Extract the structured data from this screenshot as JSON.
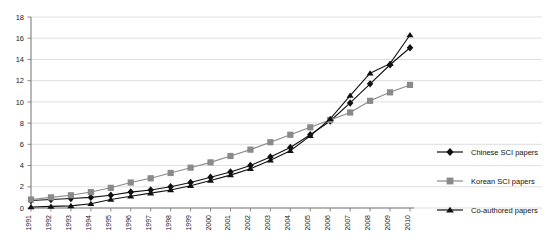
{
  "chart_data": {
    "type": "line",
    "title": "",
    "subtitle": "",
    "xlabel": "",
    "ylabel": "",
    "xlim": [
      1991,
      2010
    ],
    "ylim": [
      0,
      18
    ],
    "ytick_step": 2,
    "grid": true,
    "grid_axis": "y",
    "legend_position": "right",
    "categories": [
      "1991",
      "1992",
      "1993",
      "1994",
      "1995",
      "1996",
      "1997",
      "1998",
      "1999",
      "2000",
      "2001",
      "2002",
      "2003",
      "2004",
      "2005",
      "2006",
      "2007",
      "2008",
      "2009",
      "2010"
    ],
    "yticks": [
      0,
      2,
      4,
      6,
      8,
      10,
      12,
      14,
      16,
      18
    ],
    "series": [
      {
        "name": "Chinese SCI papers",
        "marker": "diamond",
        "color": "#111111",
        "values": [
          0.7,
          0.8,
          0.9,
          1.0,
          1.2,
          1.5,
          1.7,
          2.0,
          2.4,
          2.9,
          3.4,
          4.0,
          4.8,
          5.7,
          6.9,
          8.2,
          9.9,
          11.7,
          13.5,
          15.1
        ]
      },
      {
        "name": "Korean SCI papers",
        "marker": "square",
        "color": "#8a8a8a",
        "values": [
          0.8,
          1.0,
          1.2,
          1.5,
          1.9,
          2.4,
          2.8,
          3.3,
          3.8,
          4.3,
          4.9,
          5.5,
          6.2,
          6.9,
          7.6,
          8.3,
          9.0,
          10.1,
          10.9,
          11.6
        ]
      },
      {
        "name": "Co-authored papers",
        "marker": "triangle",
        "color": "#111111",
        "values": [
          0.1,
          0.15,
          0.2,
          0.4,
          0.8,
          1.1,
          1.4,
          1.7,
          2.1,
          2.6,
          3.1,
          3.7,
          4.5,
          5.4,
          6.8,
          8.4,
          10.6,
          12.7,
          13.6,
          16.3
        ]
      }
    ]
  },
  "legend": {
    "items": [
      {
        "label": "Chinese SCI papers",
        "marker": "diamond",
        "color": "#111111"
      },
      {
        "label": "Korean SCI papers",
        "marker": "square",
        "color": "#8a8a8a"
      },
      {
        "label": "Co-authored papers",
        "marker": "triangle",
        "color": "#111111"
      }
    ]
  },
  "colors": {
    "chinese": "#111111",
    "korean": "#8a8a8a",
    "coauthored": "#111111",
    "grid": "#c9c9c9",
    "axis": "#7d7d7d",
    "background": "#ffffff"
  }
}
